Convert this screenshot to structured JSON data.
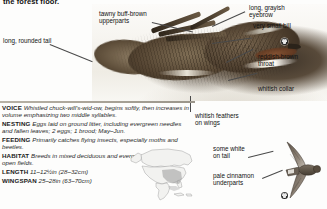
{
  "page": {
    "intro_text": "the forest floor.",
    "species": "Chuck-will's-widow"
  },
  "photo": {
    "name": "perched-nightjar-photograph",
    "alt": "Camouflaged nightjar resting on forest floor"
  },
  "callouts": [
    {
      "id": "tail",
      "name": "callout-long-rounded-tail",
      "text": "long, rounded tail"
    },
    {
      "id": "upperparts",
      "name": "callout-upperparts",
      "text": "tawny buff-brown\nupperparts"
    },
    {
      "id": "eyebrow",
      "name": "callout-eyebrow",
      "text": "long, grayish\neyebrow"
    },
    {
      "id": "bill",
      "name": "callout-very-small-bill",
      "text": "very small bill"
    },
    {
      "id": "throat",
      "name": "callout-reddish-brown-throat",
      "text": "reddish-brown\nthroat"
    },
    {
      "id": "collar",
      "name": "callout-whitish-collar",
      "text": "whitish collar"
    },
    {
      "id": "wings",
      "name": "callout-whitish-wing-feathers",
      "text": "whitish feathers\non wings"
    },
    {
      "id": "tailwhite",
      "name": "callout-some-white-on-tail",
      "text": "some white\non tail"
    },
    {
      "id": "underparts",
      "name": "callout-pale-cinnamon-underparts",
      "text": "pale cinnamon\nunderparts"
    }
  ],
  "facts": [
    {
      "key": "VOICE",
      "value": "Whistled chuck-will's-wid-ow, begins softly, then increases in volume emphasizing two middle syllables."
    },
    {
      "key": "NESTING",
      "value": "Eggs laid on ground litter, including evergreen needles and fallen leaves; 2 eggs; 1 brood; May–Jun."
    },
    {
      "key": "FEEDING",
      "value": "Primarily catches flying insects, especially moths and beetles."
    },
    {
      "key": "HABITAT",
      "value": "Breeds in mixed deciduous and evergreen forests; also open fields."
    },
    {
      "key": "LENGTH",
      "value": "11–12½in (28–32cm)"
    },
    {
      "key": "WINGSPAN",
      "value": "25–28in (63–70cm)"
    }
  ],
  "map": {
    "name": "north-america-range-map",
    "caption": "North America range map"
  },
  "flight_illustration": {
    "name": "flying-nightjar-illustration",
    "caption": "Bird in flight, underside"
  },
  "badges": [
    {
      "name": "badge-icon-head",
      "label": ""
    },
    {
      "name": "badge-icon-flight",
      "label": ""
    }
  ],
  "colors": {
    "rule": "#a8a296",
    "leader": "#4a4a4a",
    "text": "#1a1a1a",
    "map_land": "#efefef",
    "map_range": "#9e9e9e"
  }
}
